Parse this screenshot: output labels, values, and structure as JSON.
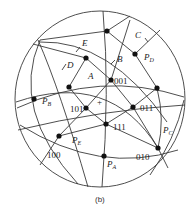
{
  "figure": {
    "caption": "(b)",
    "center_mark": "+",
    "colors": {
      "line": "#3a3a3a",
      "dot": "#111111",
      "text": "#222222",
      "background": "#ffffff"
    }
  },
  "poles": [
    {
      "id": "001",
      "label": "001"
    },
    {
      "id": "101",
      "label": "101"
    },
    {
      "id": "011",
      "label": "011"
    },
    {
      "id": "111",
      "label": "111"
    },
    {
      "id": "100",
      "label": "100"
    },
    {
      "id": "010",
      "label": "010"
    }
  ],
  "planes": {
    "A": {
      "label": "A",
      "pole": "P",
      "pole_sub": "A"
    },
    "B": {
      "label": "B",
      "pole": "P",
      "pole_sub": "B"
    },
    "C": {
      "label": "C",
      "pole": "P",
      "pole_sub": "C"
    },
    "D": {
      "label": "D",
      "pole": "P",
      "pole_sub": "D"
    },
    "E": {
      "label": "E",
      "pole": "P",
      "pole_sub": "E"
    }
  }
}
